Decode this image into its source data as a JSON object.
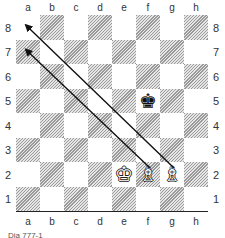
{
  "diagram": {
    "files": [
      "a",
      "b",
      "c",
      "d",
      "e",
      "f",
      "g",
      "h"
    ],
    "ranks": [
      "8",
      "7",
      "6",
      "5",
      "4",
      "3",
      "2",
      "1"
    ],
    "pieces": [
      {
        "square": "f5",
        "type": "king",
        "color": "black",
        "glyph": "♚"
      },
      {
        "square": "e2",
        "type": "king",
        "color": "white",
        "glyph": "♔"
      },
      {
        "square": "f2",
        "type": "bishop",
        "color": "white",
        "glyph": "♗"
      },
      {
        "square": "g2",
        "type": "bishop",
        "color": "white",
        "glyph": "♗"
      }
    ],
    "arrows": [
      {
        "from": "g2",
        "to": "a8"
      },
      {
        "from": "f2",
        "to": "a7"
      }
    ],
    "caption": "Dia 777-1"
  }
}
